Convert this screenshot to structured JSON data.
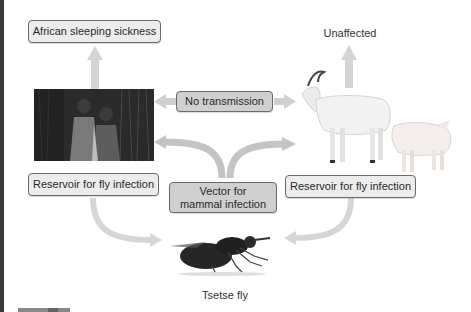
{
  "diagram": {
    "nodes": {
      "disease": "African sleeping sickness",
      "unaffected": "Unaffected",
      "no_transmission": "No transmission",
      "reservoir_left": "Reservoir for fly infection",
      "reservoir_right": "Reservoir for fly infection",
      "vector": "Vector for\nmammal infection",
      "vector_line1": "Vector for",
      "vector_line2": "mammal infection",
      "fly": "Tsetse fly"
    },
    "images": {
      "humans": "children-photo",
      "animals": "goat-and-pig-photo",
      "fly": "tsetse-fly-photo"
    },
    "colors": {
      "arrow": "#c8c8c8",
      "box_light": "#ececec",
      "box_dark": "#cfcfcf",
      "border": "#6b6b6b"
    }
  }
}
